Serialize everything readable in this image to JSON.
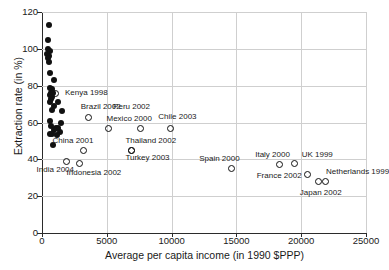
{
  "chart_data": {
    "type": "scatter",
    "title": "",
    "xlabel": "Average per capita income (in 1990 $PPP)",
    "ylabel": "Extraction rate (in %)",
    "xlim": [
      0,
      25000
    ],
    "ylim": [
      0,
      120
    ],
    "xticks": [
      "0",
      "5000",
      "10000",
      "15000",
      "20000",
      "25000"
    ],
    "xtick_values": [
      0,
      5000,
      10000,
      15000,
      20000,
      25000
    ],
    "yticks": [
      "0",
      "20",
      "40",
      "60",
      "80",
      "100",
      "120"
    ],
    "ytick_values": [
      0,
      20,
      40,
      60,
      80,
      100,
      120
    ],
    "grid": true,
    "legend": null,
    "series": [
      {
        "name": "unlabeled-countries",
        "marker": "filled-circle",
        "color": "#111111",
        "points": [
          {
            "x": 520,
            "y": 113
          },
          {
            "x": 470,
            "y": 105
          },
          {
            "x": 430,
            "y": 100
          },
          {
            "x": 600,
            "y": 99
          },
          {
            "x": 420,
            "y": 97
          },
          {
            "x": 520,
            "y": 96
          },
          {
            "x": 470,
            "y": 95
          },
          {
            "x": 560,
            "y": 93
          },
          {
            "x": 600,
            "y": 87
          },
          {
            "x": 900,
            "y": 83
          },
          {
            "x": 600,
            "y": 79
          },
          {
            "x": 760,
            "y": 78
          },
          {
            "x": 700,
            "y": 76
          },
          {
            "x": 830,
            "y": 76
          },
          {
            "x": 640,
            "y": 75
          },
          {
            "x": 760,
            "y": 74
          },
          {
            "x": 700,
            "y": 73
          },
          {
            "x": 620,
            "y": 71
          },
          {
            "x": 1250,
            "y": 71
          },
          {
            "x": 900,
            "y": 69
          },
          {
            "x": 760,
            "y": 67
          },
          {
            "x": 1520,
            "y": 66
          },
          {
            "x": 600,
            "y": 61
          },
          {
            "x": 1500,
            "y": 60
          },
          {
            "x": 700,
            "y": 58
          },
          {
            "x": 1050,
            "y": 57
          },
          {
            "x": 1250,
            "y": 57
          },
          {
            "x": 900,
            "y": 56
          },
          {
            "x": 1380,
            "y": 55
          },
          {
            "x": 600,
            "y": 54
          },
          {
            "x": 760,
            "y": 54
          },
          {
            "x": 1150,
            "y": 53
          },
          {
            "x": 860,
            "y": 48
          }
        ]
      },
      {
        "name": "labeled-countries",
        "marker": "open-circle",
        "color": "#111111",
        "points": [
          {
            "label": "Kenya 1998",
            "x": 1000,
            "y": 76,
            "label_dx": 10,
            "label_dy": -1
          },
          {
            "label": "Brazil 2002",
            "x": 3600,
            "y": 63,
            "label_dx": -8,
            "label_dy": -11
          },
          {
            "label": "Peru 2002",
            "x": 5100,
            "y": 57,
            "label_dx": 5,
            "label_dy": -22
          },
          {
            "label": "Mexico 2000",
            "x": 7600,
            "y": 57,
            "label_dx": -34,
            "label_dy": -10
          },
          {
            "label": "Chile 2003",
            "x": 9900,
            "y": 57,
            "label_dx": -12,
            "label_dy": -12
          },
          {
            "label": "China 2001",
            "x": 3200,
            "y": 45,
            "label_dx": -31,
            "label_dy": -10
          },
          {
            "label": "Thailand 2002",
            "x": 6900,
            "y": 45,
            "label_dx": -6,
            "label_dy": -10
          },
          {
            "label": "Turkey 2003",
            "x": 6900,
            "y": 45,
            "label_dx": -6,
            "label_dy": 7
          },
          {
            "label": "India 2004",
            "x": 1900,
            "y": 39,
            "label_dx": -30,
            "label_dy": 8
          },
          {
            "label": "Indonesia 2002",
            "x": 2900,
            "y": 38,
            "label_dx": -13,
            "label_dy": 9
          },
          {
            "label": "Spain 2000",
            "x": 14600,
            "y": 35,
            "label_dx": -32,
            "label_dy": -11
          },
          {
            "label": "Italy 2000",
            "x": 18300,
            "y": 37,
            "label_dx": -24,
            "label_dy": -11
          },
          {
            "label": "UK 1999",
            "x": 19500,
            "y": 38,
            "label_dx": 7,
            "label_dy": -9
          },
          {
            "label": "France 2002",
            "x": 20500,
            "y": 32,
            "label_dx": -51,
            "label_dy": 1
          },
          {
            "label": "Netherlands 1999",
            "x": 21300,
            "y": 28,
            "label_dx": 8,
            "label_dy": -10
          },
          {
            "label": "Japan 2002",
            "x": 21900,
            "y": 28,
            "label_dx": -26,
            "label_dy": 11
          }
        ]
      }
    ]
  }
}
